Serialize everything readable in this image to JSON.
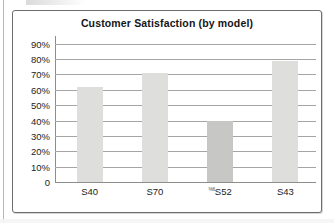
{
  "chart_data": {
    "type": "bar",
    "title": "Customer Satisfaction (by model)",
    "xlabel": "",
    "ylabel": "",
    "categories": [
      "S40",
      "S70",
      "S52",
      "S43"
    ],
    "values": [
      62,
      71,
      40,
      79
    ],
    "value_labels": [
      "62%",
      "71%",
      "40%",
      "79%"
    ],
    "ylim": [
      0,
      95
    ],
    "ytick_values": [
      90,
      80,
      70,
      60,
      50,
      40,
      30,
      20,
      10,
      0
    ],
    "ytick_labels": [
      "90%",
      "80%",
      "70%",
      "60%",
      "50%",
      "40%",
      "30%",
      "20%",
      "10%",
      "0"
    ],
    "grid": true,
    "legend": false,
    "bar_color": "#dededd",
    "highlight_color": "#c7c7c6",
    "highlight_index": 2,
    "x_label_prefix_artifact": "%6",
    "artifact_index": 2
  },
  "frame": {
    "border_color": "#6d6d6d"
  }
}
